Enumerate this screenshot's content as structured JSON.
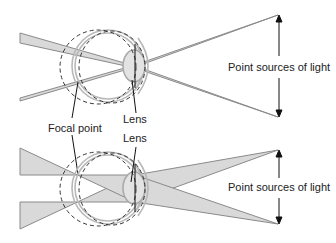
{
  "figure": {
    "top_panel": {
      "label_point_sources": "Point sources of light",
      "label_lens": "Lens"
    },
    "shared": {
      "label_focal_point": "Focal point"
    },
    "bottom_panel": {
      "label_point_sources": "Point sources of light",
      "label_lens": "Lens"
    }
  },
  "colors": {
    "ray_stroke": "#8a8a8a",
    "ray_fill": "#d9d9d9",
    "eye_stroke": "#b8b8b8",
    "dash_stroke": "#333333",
    "pointer": "#111111"
  }
}
